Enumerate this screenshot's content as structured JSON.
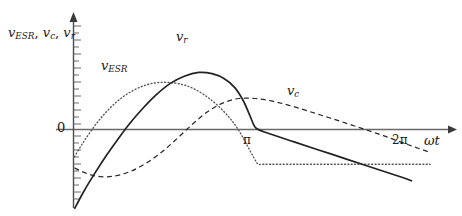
{
  "figure": {
    "background_color": "#ffffff",
    "line_color": "#2a2a2a",
    "axis_color": "#555555"
  },
  "axes": {
    "y_axis_label_prefix": "v",
    "y_axis_label": "v_ESR, v_c, v_r",
    "y_axis_label_parts": [
      {
        "base": "v",
        "sub": "ESR"
      },
      {
        "base": "v",
        "sub": "c"
      },
      {
        "base": "v",
        "sub": "r"
      }
    ],
    "x_axis_label": "ωt",
    "zero_label": "0",
    "x_ticks": [
      {
        "label": "π",
        "value": 3.14159
      },
      {
        "label": "2π",
        "value": 6.28319
      }
    ]
  },
  "curves": [
    {
      "name": "v_ESR",
      "label_base": "v",
      "label_sub": "ESR",
      "style": "dotted",
      "color": "#4d4d4d"
    },
    {
      "name": "v_r",
      "label_base": "v",
      "label_sub": "r",
      "style": "solid",
      "color": "#2a2a2a"
    },
    {
      "name": "v_c",
      "label_base": "v",
      "label_sub": "c",
      "style": "dashed",
      "color": "#2a2a2a"
    }
  ],
  "chart_data": {
    "type": "line",
    "title": "",
    "xlabel": "ωt",
    "ylabel": "v_ESR, v_c, v_r",
    "xlim": [
      0,
      7.3
    ],
    "ylim": [
      -1.35,
      1.15
    ],
    "grid": false,
    "legend": "inline-annotations",
    "x_tick_labels": [
      "π",
      "2π"
    ],
    "x_tick_values": [
      3.14159,
      6.28319
    ],
    "annotations": [
      {
        "text": "v_ESR",
        "x": 1.0,
        "y": 0.62
      },
      {
        "text": "v_r",
        "x": 2.45,
        "y": 0.97
      },
      {
        "text": "v_c",
        "x": 4.65,
        "y": 0.42
      },
      {
        "text": "0",
        "x": -0.18,
        "y": 0.04
      },
      {
        "text": "π",
        "x": 3.2,
        "y": -0.13
      },
      {
        "text": "2π",
        "x": 6.3,
        "y": -0.13
      }
    ],
    "series": [
      {
        "name": "v_ESR",
        "style": "dotted",
        "points": [
          [
            0.02,
            -0.44
          ],
          [
            0.18,
            -0.22
          ],
          [
            0.38,
            0.02
          ],
          [
            0.58,
            0.23
          ],
          [
            0.82,
            0.43
          ],
          [
            1.06,
            0.58
          ],
          [
            1.32,
            0.69
          ],
          [
            1.58,
            0.75
          ],
          [
            1.84,
            0.76
          ],
          [
            2.1,
            0.73
          ],
          [
            2.34,
            0.66
          ],
          [
            2.58,
            0.54
          ],
          [
            2.82,
            0.38
          ],
          [
            3.06,
            0.17
          ],
          [
            3.24,
            -0.04
          ],
          [
            3.4,
            -0.28
          ],
          [
            3.52,
            -0.46
          ],
          [
            3.6,
            -0.56
          ],
          [
            3.72,
            -0.56
          ],
          [
            4.4,
            -0.56
          ],
          [
            5.4,
            -0.56
          ],
          [
            6.4,
            -0.56
          ],
          [
            6.95,
            -0.56
          ]
        ]
      },
      {
        "name": "v_r",
        "style": "solid",
        "points": [
          [
            0.02,
            -1.28
          ],
          [
            0.2,
            -1.0
          ],
          [
            0.42,
            -0.7
          ],
          [
            0.64,
            -0.42
          ],
          [
            0.88,
            -0.14
          ],
          [
            1.1,
            0.1
          ],
          [
            1.34,
            0.33
          ],
          [
            1.6,
            0.55
          ],
          [
            1.88,
            0.74
          ],
          [
            2.16,
            0.86
          ],
          [
            2.44,
            0.92
          ],
          [
            2.7,
            0.9
          ],
          [
            2.94,
            0.82
          ],
          [
            3.14,
            0.68
          ],
          [
            3.3,
            0.48
          ],
          [
            3.42,
            0.26
          ],
          [
            3.5,
            0.1
          ],
          [
            3.56,
            0.02
          ],
          [
            3.72,
            -0.04
          ],
          [
            4.3,
            -0.2
          ],
          [
            5.0,
            -0.39
          ],
          [
            5.7,
            -0.58
          ],
          [
            6.4,
            -0.77
          ],
          [
            6.6,
            -0.83
          ]
        ]
      },
      {
        "name": "v_c",
        "style": "dashed",
        "points": [
          [
            0.02,
            -0.62
          ],
          [
            0.26,
            -0.71
          ],
          [
            0.52,
            -0.76
          ],
          [
            0.8,
            -0.75
          ],
          [
            1.1,
            -0.68
          ],
          [
            1.42,
            -0.54
          ],
          [
            1.74,
            -0.35
          ],
          [
            2.04,
            -0.13
          ],
          [
            2.34,
            0.1
          ],
          [
            2.62,
            0.29
          ],
          [
            2.92,
            0.43
          ],
          [
            3.22,
            0.5
          ],
          [
            3.54,
            0.5
          ],
          [
            3.86,
            0.46
          ],
          [
            4.2,
            0.39
          ],
          [
            4.6,
            0.29
          ],
          [
            5.06,
            0.17
          ],
          [
            5.54,
            0.04
          ],
          [
            6.04,
            -0.1
          ],
          [
            6.54,
            -0.25
          ],
          [
            6.92,
            -0.36
          ]
        ]
      }
    ]
  }
}
